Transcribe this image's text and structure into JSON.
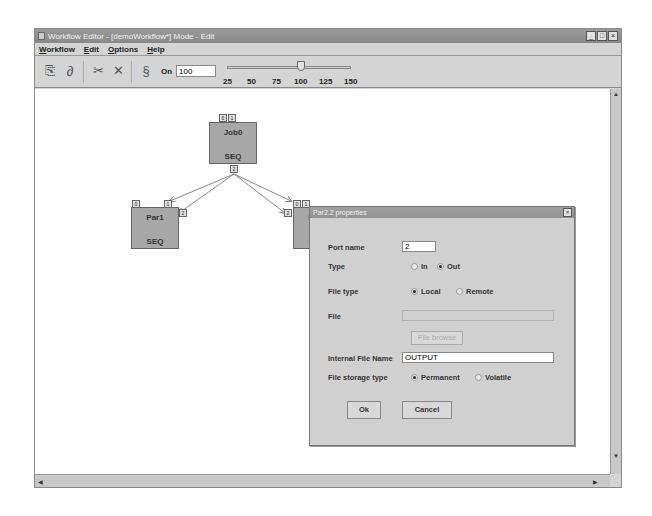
{
  "window": {
    "title": "Workflow Editor - [demoWorkflow*] Mode - Edit",
    "controls": [
      "_",
      "□",
      "×"
    ]
  },
  "menubar": {
    "items": [
      "Workflow",
      "Edit",
      "Options",
      "Help"
    ]
  },
  "toolbar": {
    "icons": [
      "open-icon",
      "link-icon",
      "cut-icon",
      "delete-icon",
      "zoom-icon"
    ],
    "zoom_label": "On",
    "zoom_value": "100",
    "slider": {
      "ticks": [
        "25",
        "50",
        "75",
        "100",
        "125",
        "150"
      ],
      "value": 100
    }
  },
  "canvas": {
    "nodes": [
      {
        "name": "Job0",
        "type": "SEQ"
      },
      {
        "name": "Par1",
        "type": "SEQ"
      },
      {
        "name": "Par2",
        "type": "SEQ"
      }
    ],
    "ports": {
      "job0_in": [
        "0",
        "1"
      ],
      "job0_out": "2",
      "par1": [
        "0",
        "1",
        "2"
      ],
      "par2": [
        "0",
        "1",
        "2"
      ]
    }
  },
  "dialog": {
    "title": "Par2.2 properties",
    "close": "×",
    "port_name_label": "Port name",
    "port_name_value": "2",
    "type_label": "Type",
    "type_options": [
      "In",
      "Out"
    ],
    "type_selected": "Out",
    "file_type_label": "File type",
    "file_type_options": [
      "Local",
      "Remote"
    ],
    "file_type_selected": "Local",
    "file_label": "File",
    "file_value": "",
    "file_browse_label": "File browse",
    "internal_file_name_label": "Internal File Name",
    "internal_file_name_value": "OUTPUT",
    "storage_type_label": "File storage type",
    "storage_options": [
      "Permanent",
      "Volatile"
    ],
    "storage_selected": "Permanent",
    "ok_label": "Ok",
    "cancel_label": "Cancel"
  }
}
